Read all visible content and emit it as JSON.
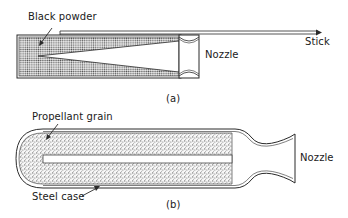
{
  "figure_a": {
    "caption": "(a)",
    "labels": {
      "black_powder": "Black powder",
      "nozzle": "Nozzle",
      "stick": "Stick"
    }
  },
  "figure_b": {
    "caption": "(b)",
    "labels": {
      "propellant_grain": "Propellant grain",
      "nozzle": "Nozzle",
      "steel_case": "Steel case"
    }
  },
  "colors": {
    "line": "#2a2a2a",
    "fill": "#bdbdbd",
    "background": "#ffffff"
  }
}
